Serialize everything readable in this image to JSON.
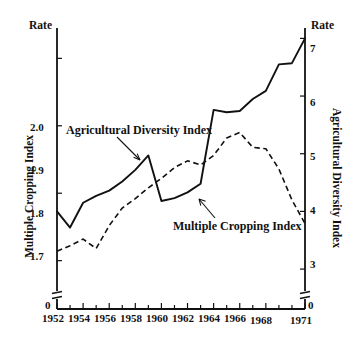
{
  "chart_data": {
    "type": "line",
    "title": "",
    "xlabel": "",
    "grid": false,
    "legend_position": "inline-annotations",
    "x": [
      1952,
      1953,
      1954,
      1955,
      1956,
      1957,
      1958,
      1959,
      1960,
      1961,
      1962,
      1963,
      1964,
      1965,
      1966,
      1967,
      1968,
      1969,
      1970,
      1971
    ],
    "xtick_labels": [
      "1952",
      "1954",
      "1956",
      "1958",
      "1960",
      "1962",
      "1964",
      "1966",
      "1968",
      "1971"
    ],
    "xtick_values": [
      1952,
      1954,
      1956,
      1958,
      1960,
      1962,
      1964,
      1966,
      1968,
      1971
    ],
    "xlim": [
      1952,
      1971
    ],
    "left_axis": {
      "name": "Multiple Cropping Index",
      "rate_label": "Rate",
      "tick_labels": [
        "2.0",
        "1.9",
        "1.8",
        "1.7",
        "0"
      ],
      "tick_values": [
        2.0,
        1.9,
        1.8,
        1.7,
        0
      ],
      "ylim": [
        1.655,
        2.045
      ],
      "axis_break": true,
      "zero_label": "0"
    },
    "right_axis": {
      "name": "Agricultural Diversity Index",
      "rate_label": "Rate",
      "tick_labels": [
        "7",
        "6",
        "5",
        "4",
        "3",
        "0"
      ],
      "tick_values": [
        7,
        6,
        5,
        4,
        3,
        0
      ],
      "ylim": [
        2.62,
        7.18
      ],
      "axis_break": true,
      "zero_label": "0"
    },
    "series": [
      {
        "name": "Agricultural Diversity Index",
        "axis": "right",
        "style": "solid",
        "annotation": "Agricultural Diversity Index",
        "values": [
          4.0,
          3.72,
          4.15,
          4.27,
          4.36,
          4.52,
          4.72,
          4.97,
          4.18,
          4.23,
          4.33,
          4.48,
          5.76,
          5.72,
          5.74,
          5.95,
          6.09,
          6.55,
          6.57,
          7.0
        ]
      },
      {
        "name": "Multiple Cropping Index",
        "axis": "left",
        "style": "dashed",
        "annotation": "Multiple Cropping Index",
        "values": [
          1.714,
          1.722,
          1.732,
          1.718,
          1.752,
          1.778,
          1.792,
          1.808,
          1.822,
          1.838,
          1.848,
          1.842,
          1.856,
          1.882,
          1.89,
          1.868,
          1.866,
          1.836,
          1.79,
          1.755
        ]
      }
    ],
    "annotations": [
      {
        "text": "Agricultural Diversity Index",
        "points_to_series": "Agricultural Diversity Index"
      },
      {
        "text": "Multiple Cropping Index",
        "points_to_series": "Multiple Cropping Index"
      }
    ]
  },
  "labels": {
    "rate_left": "Rate",
    "rate_right": "Rate",
    "y_left_title": "Multiple Cropping Index",
    "y_right_title": "Agricultural Diversity Index",
    "ann_solid": "Agricultural Diversity Index",
    "ann_dashed": "Multiple Cropping Index",
    "left_ticks": {
      "t0": "2.0",
      "t1": "1.9",
      "t2": "1.8",
      "t3": "1.7",
      "t4": "0"
    },
    "right_ticks": {
      "t0": "7",
      "t1": "6",
      "t2": "5",
      "t3": "4",
      "t4": "3",
      "t5": "0"
    },
    "x_ticks": {
      "x0": "1952",
      "x1": "1954",
      "x2": "1956",
      "x3": "1958",
      "x4": "1960",
      "x5": "1962",
      "x6": "1964",
      "x7": "1966",
      "x8": "1968",
      "x9": "1971"
    }
  }
}
